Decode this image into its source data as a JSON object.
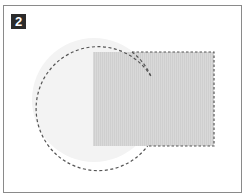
{
  "figure": {
    "badge_label": "2",
    "colors": {
      "frame_border": "#8a8a8a",
      "badge_bg": "#2b2b2b",
      "badge_text": "#ffffff",
      "circle_fill": "#f3f3f3",
      "rect_fill": "#d6d6d6",
      "outline": "#555555"
    },
    "shapes": [
      {
        "type": "circle",
        "name": "circle",
        "cx": 94,
        "cy": 100,
        "r": 62
      },
      {
        "type": "rect",
        "name": "rectangle",
        "x": 93,
        "y": 52,
        "width": 121,
        "height": 94
      }
    ],
    "outline_style": "dashed"
  }
}
